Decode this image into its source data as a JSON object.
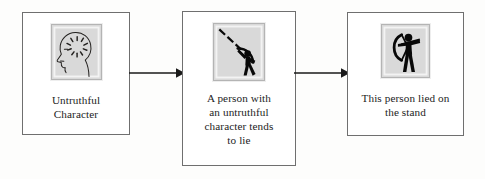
{
  "diagram": {
    "type": "flowchart",
    "orientation": "left-to-right",
    "background_color": "#fdfdfc",
    "box_border_color": "#6f6f6f",
    "icon_frame_fill": "#d9d9d9",
    "icon_ink_color": "#000000",
    "nodes": [
      {
        "id": "character",
        "icon_name": "head-profile-with-thoughts-icon",
        "icon_description": "left-facing head outline with radiating dashes inside the skull",
        "caption_lines": [
          "Untruthful",
          "Character"
        ],
        "caption_text": "Untruthful Character"
      },
      {
        "id": "tendency",
        "icon_name": "archer-arrow-in-flight-icon",
        "icon_description": "black archer silhouette with bow and dashed arrow trajectory to upper left",
        "caption_lines": [
          "A person with",
          "an untruthful",
          "character tends",
          "to lie"
        ],
        "caption_text": "A person with an untruthful character tends to lie"
      },
      {
        "id": "conclusion",
        "icon_name": "archer-aiming-bow-icon",
        "icon_description": "black archer silhouette facing right with bow drawn",
        "caption_lines": [
          "This person lied on",
          "the stand"
        ],
        "caption_text": "This person lied on the stand"
      }
    ],
    "connectors": [
      {
        "id": "arrow-1",
        "from": "character",
        "to": "tendency",
        "style": "solid-line-with-filled-arrowhead",
        "direction": "right"
      },
      {
        "id": "arrow-2",
        "from": "tendency",
        "to": "conclusion",
        "style": "solid-line-with-filled-arrowhead",
        "direction": "right"
      }
    ]
  }
}
